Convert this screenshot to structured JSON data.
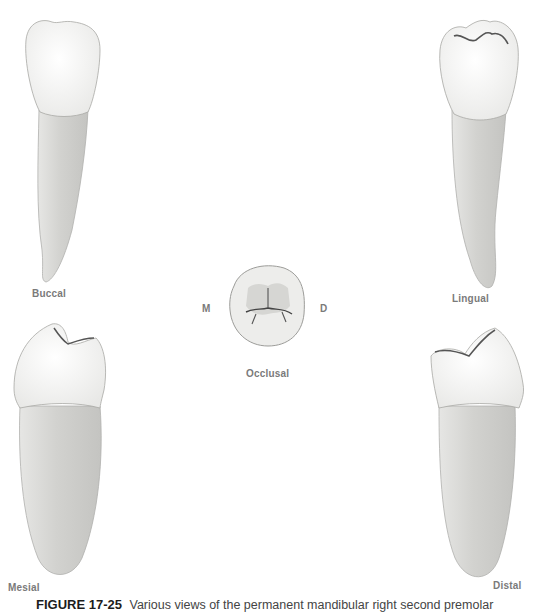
{
  "figure": {
    "number": "FIGURE 17-25",
    "caption": "Various views of the permanent mandibular right second premolar"
  },
  "views": [
    {
      "id": "buccal",
      "label": "Buccal"
    },
    {
      "id": "lingual",
      "label": "Lingual"
    },
    {
      "id": "occlusal",
      "label": "Occlusal"
    },
    {
      "id": "mesial",
      "label": "Mesial"
    },
    {
      "id": "distal",
      "label": "Distal"
    }
  ],
  "orientation": {
    "mesial_marker": "M",
    "distal_marker": "D"
  },
  "colors": {
    "crown": "#f7f7f5",
    "root": "#d9d9d6",
    "outline": "#9a9a9a",
    "label": "#7a7a7a"
  }
}
